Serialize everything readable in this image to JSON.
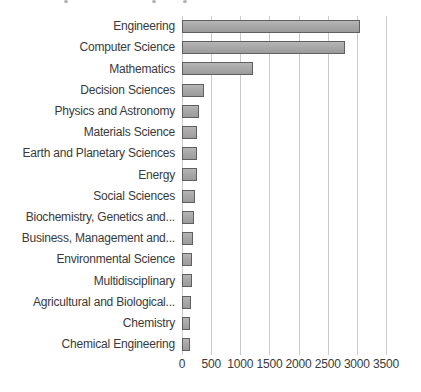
{
  "chart_data": {
    "type": "bar",
    "orientation": "horizontal",
    "title": "",
    "xlabel": "",
    "ylabel": "",
    "categories": [
      "Engineering",
      "Computer Science",
      "Mathematics",
      "Decision Sciences",
      "Physics and Astronomy",
      "Materials Science",
      "Earth and Planetary Sciences",
      "Energy",
      "Social Sciences",
      "Biochemistry, Genetics and...",
      "Business, Management and...",
      "Environmental Science",
      "Multidisciplinary",
      "Agricultural and Biological...",
      "Chemistry",
      "Chemical Engineering"
    ],
    "values": [
      3060,
      2790,
      1220,
      380,
      300,
      265,
      255,
      250,
      220,
      210,
      195,
      180,
      170,
      155,
      145,
      140
    ],
    "xlim": [
      0,
      3500
    ],
    "x_ticks": [
      0,
      500,
      1000,
      1500,
      2000,
      2500,
      3000,
      3500
    ],
    "x_tick_labels": [
      "0",
      "500",
      "1000",
      "1500",
      "2000",
      "2500",
      "3000",
      "3500"
    ],
    "grid": "vertical",
    "legend": "none",
    "colors": {
      "bar_fill": "#a8a8a8",
      "bar_border": "#5f5f5f",
      "gridline": "#cbcbcb",
      "text": "#3a3a3a",
      "background": "#ffffff"
    }
  }
}
